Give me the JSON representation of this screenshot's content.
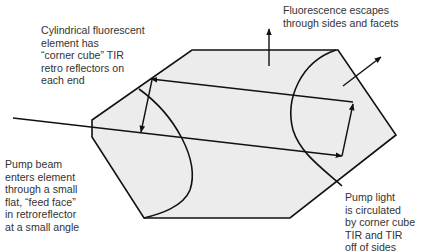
{
  "diagram": {
    "colors": {
      "element_fill": "#ececec",
      "line": "#111111",
      "text": "#333333",
      "background": "#ffffff"
    },
    "labels": {
      "cylindrical_element": "Cylindrical fluorescent\nelement has\n“corner cube” TIR\nretro reflectors on\neach end",
      "fluorescence_escapes": "Fluorescence escapes\nthrough sides and facets",
      "pump_beam_enters": "Pump beam\nenters element\nthrough a small\nflat, “feed face”\nin retroreflector\nat a small angle",
      "pump_light_circulated": "Pump light\nis circulated\nby corner cube\nTIR and TIR\noff of sides"
    },
    "components": [
      {
        "name": "fluorescent-element",
        "shape": "hexagonal cross-section"
      },
      {
        "name": "left-retroreflector-curve",
        "shape": "curved interface"
      },
      {
        "name": "right-retroreflector-curve",
        "shape": "curved interface"
      },
      {
        "name": "pump-beam-incoming",
        "shape": "arrow"
      },
      {
        "name": "pump-ray-up",
        "shape": "arrow"
      },
      {
        "name": "pump-ray-return",
        "shape": "arrow"
      },
      {
        "name": "pump-ray-down",
        "shape": "arrow"
      },
      {
        "name": "fluorescence-escape-up",
        "shape": "arrow"
      },
      {
        "name": "fluorescence-escape-diagonal",
        "shape": "arrow"
      }
    ]
  }
}
